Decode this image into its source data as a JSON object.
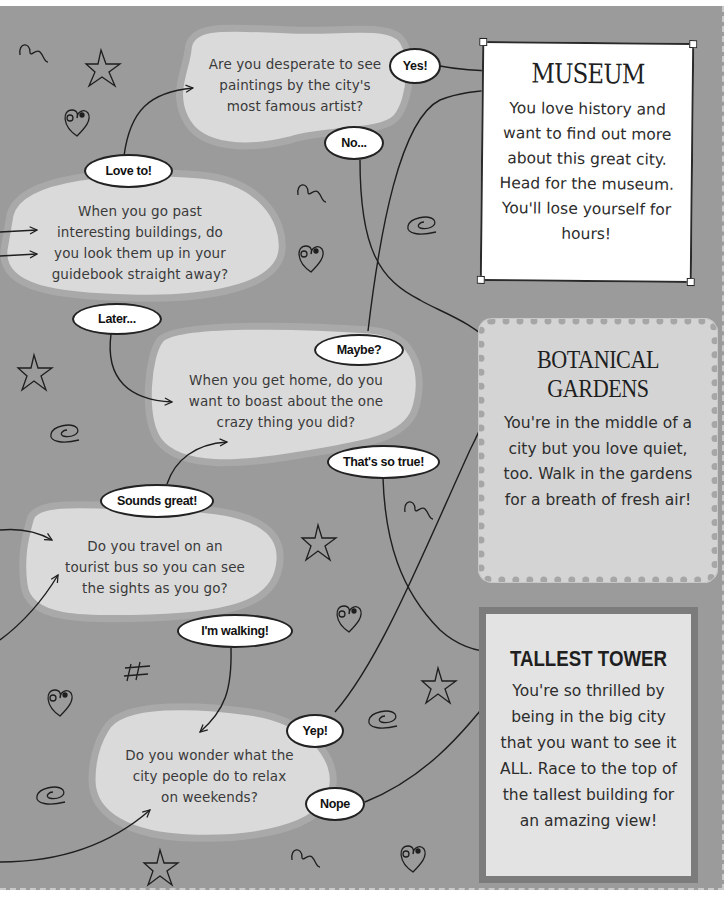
{
  "questions": [
    {
      "id": "paintings",
      "text": "Are you desperate to see paintings by the city's most famous artist?"
    },
    {
      "id": "buildings",
      "text": "When you go past interesting buildings, do you look them up in your guidebook straight away?"
    },
    {
      "id": "boast",
      "text": "When you get home, do you want to boast about the one crazy thing you did?"
    },
    {
      "id": "bus",
      "text": "Do you travel on an tourist bus so you can see the sights as you go?"
    },
    {
      "id": "relax",
      "text": "Do you wonder what the city people do to relax on weekends?"
    }
  ],
  "answers": {
    "yes": "Yes!",
    "no": "No...",
    "love_to": "Love to!",
    "later": "Later...",
    "maybe": "Maybe?",
    "thats_so_true": "That's so true!",
    "sounds_great": "Sounds great!",
    "im_walking": "I'm walking!",
    "yep": "Yep!",
    "nope": "Nope"
  },
  "results": {
    "museum": {
      "title": "MUSEUM",
      "body": "You love history and want to find out more about this great city. Head for the museum. You'll lose yourself for hours!"
    },
    "gardens": {
      "title_line1": "BOTANICAL",
      "title_line2": "GARDENS",
      "body": "You're in the middle of a city but you love quiet, too. Walk in the gardens for a breath of fresh air!"
    },
    "tower": {
      "title": "TALLEST TOWER",
      "body": "You're so thrilled by being in the big city that you want to see it ALL. Race to the top of the tallest building for an amazing view!"
    }
  },
  "colors": {
    "page_bg": "#9b9b9b",
    "blob_fill": "#dadada",
    "blob_border": "#a9a9a9",
    "line": "#1e1e1e"
  },
  "decorations": [
    "squiggle-icon",
    "star-icon",
    "heart-icon",
    "spiral-icon",
    "hash-icon"
  ]
}
